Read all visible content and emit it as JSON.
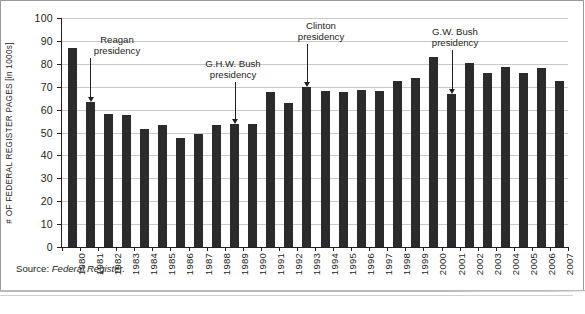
{
  "figure": {
    "y_axis_title": "# OF FEDERAL REGISTER PAGES [in 1000s]",
    "source_prefix": "Source:",
    "source_name": "Federal Register."
  },
  "chart_data": {
    "type": "bar",
    "title": "",
    "xlabel": "",
    "ylabel": "# OF FEDERAL REGISTER PAGES [in 1000s]",
    "ylim": [
      0,
      100
    ],
    "yticks": [
      0,
      10,
      20,
      30,
      40,
      50,
      60,
      70,
      80,
      90,
      100
    ],
    "ytick_labels": [
      "0",
      "10",
      "20",
      "30",
      "40",
      "50",
      "60",
      "70",
      "80",
      "90",
      "100"
    ],
    "grid": true,
    "legend": "none",
    "bar_color": "#2b2b2b",
    "categories": [
      "1980",
      "1981",
      "1982",
      "1983",
      "1984",
      "1985",
      "1986",
      "1987",
      "1988",
      "1989",
      "1990",
      "1991",
      "1992",
      "1993",
      "1994",
      "1995",
      "1996",
      "1997",
      "1998",
      "1999",
      "2000",
      "2001",
      "2002",
      "2003",
      "2004",
      "2005",
      "2006",
      "2007"
    ],
    "values": [
      87.0,
      63.5,
      58.0,
      57.5,
      51.5,
      53.5,
      47.5,
      49.5,
      53.5,
      53.8,
      53.6,
      67.7,
      62.9,
      69.7,
      68.1,
      67.5,
      68.5,
      68.0,
      72.5,
      73.9,
      83.0,
      67.0,
      80.3,
      75.8,
      78.5,
      75.9,
      78.3,
      72.7
    ],
    "annotations": [
      {
        "id": "reagan",
        "label_line1": "Reagan",
        "label_line2": "presidency",
        "target_category": "1981"
      },
      {
        "id": "ghw-bush",
        "label_line1": "G.H.W. Bush",
        "label_line2": "presidency",
        "target_category": "1989"
      },
      {
        "id": "clinton",
        "label_line1": "Clinton",
        "label_line2": "presidency",
        "target_category": "1993"
      },
      {
        "id": "gw-bush",
        "label_line1": "G.W. Bush",
        "label_line2": "presidency",
        "target_category": "2001"
      }
    ]
  }
}
